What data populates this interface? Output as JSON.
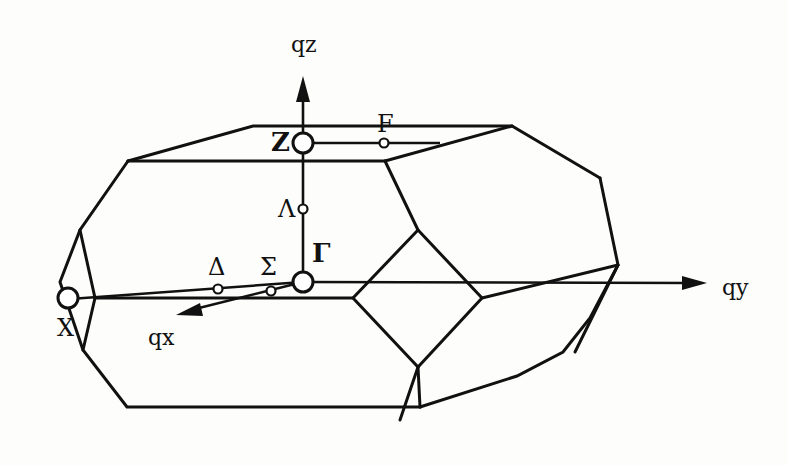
{
  "figure": {
    "colors": {
      "line": "#111111",
      "background": "#fdfdfb",
      "point_fill": "#ffffff"
    },
    "axes": {
      "qz": {
        "label": "qz"
      },
      "qy": {
        "label": "qy"
      },
      "qx": {
        "label": "qx"
      }
    },
    "high_symmetry_points": {
      "gamma": {
        "label": "Γ"
      },
      "z": {
        "label": "Z"
      },
      "x": {
        "label": "X"
      }
    },
    "path_points": {
      "f": {
        "label": "F"
      },
      "lambda": {
        "label": "Λ"
      },
      "delta": {
        "label": "Δ"
      },
      "sigma": {
        "label": "Σ"
      }
    }
  }
}
